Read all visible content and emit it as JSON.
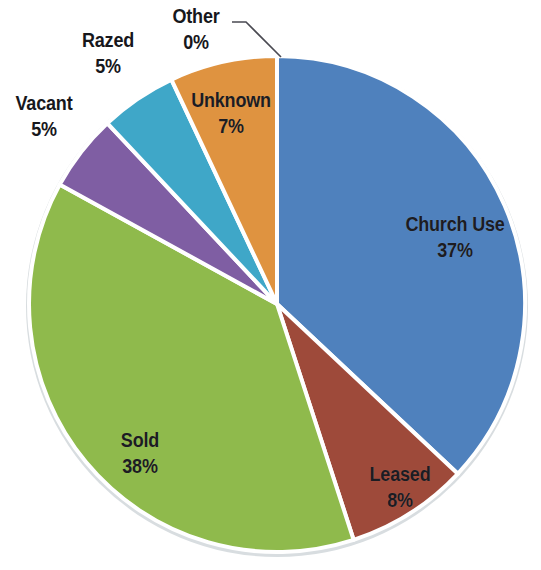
{
  "chart_data": {
    "type": "pie",
    "title": "",
    "subtitle": "",
    "xlabel": "",
    "ylabel": "",
    "legend_position": "none",
    "grid": false,
    "labels_show_percent": true,
    "categories": [
      "Church Use",
      "Leased",
      "Sold",
      "Vacant",
      "Razed",
      "Unknown",
      "Other"
    ],
    "values": [
      37,
      8,
      38,
      5,
      5,
      7,
      0
    ],
    "value_labels": [
      "37%",
      "8%",
      "38%",
      "5%",
      "5%",
      "7%",
      "0%"
    ],
    "colors": [
      "#4f81bd",
      "#9e4a3a",
      "#8fba4c",
      "#7f5ea3",
      "#3fa7c8",
      "#df9340",
      "#4f81bd"
    ],
    "slices": [
      {
        "name": "Church Use",
        "value": 37,
        "value_label": "37%",
        "color": "#4f81bd",
        "start_angle": 0,
        "end_angle": 133.2,
        "label_placement": "inside",
        "label_x": 455,
        "label_y": 212
      },
      {
        "name": "Leased",
        "value": 8,
        "value_label": "8%",
        "color": "#9e4a3a",
        "start_angle": 133.2,
        "end_angle": 162,
        "label_placement": "inside",
        "label_x": 400,
        "label_y": 462
      },
      {
        "name": "Sold",
        "value": 38,
        "value_label": "38%",
        "color": "#8fba4c",
        "start_angle": 162,
        "end_angle": 298.8,
        "label_placement": "inside",
        "label_x": 140,
        "label_y": 428
      },
      {
        "name": "Vacant",
        "value": 5,
        "value_label": "5%",
        "color": "#7f5ea3",
        "start_angle": 298.8,
        "end_angle": 316.8,
        "label_placement": "outside",
        "label_x": 44,
        "label_y": 91
      },
      {
        "name": "Razed",
        "value": 5,
        "value_label": "5%",
        "color": "#3fa7c8",
        "start_angle": 316.8,
        "end_angle": 334.8,
        "label_placement": "outside",
        "label_x": 108,
        "label_y": 28
      },
      {
        "name": "Unknown",
        "value": 7,
        "value_label": "7%",
        "color": "#df9340",
        "start_angle": 334.8,
        "end_angle": 360,
        "label_placement": "inside",
        "label_x": 231,
        "label_y": 88
      },
      {
        "name": "Other",
        "value": 0,
        "value_label": "0%",
        "color": "#4f81bd",
        "start_angle": 360,
        "end_angle": 360,
        "label_placement": "outside-leader",
        "label_x": 196,
        "label_y": 4,
        "leader_from_x": 232,
        "leader_from_y": 22,
        "leader_to_x": 281,
        "leader_to_y": 57
      }
    ],
    "geometry": {
      "center_x": 277,
      "center_y": 304,
      "radius": 248,
      "slice_gap_color": "#ffffff",
      "rim_color": "#d8dde0"
    }
  }
}
